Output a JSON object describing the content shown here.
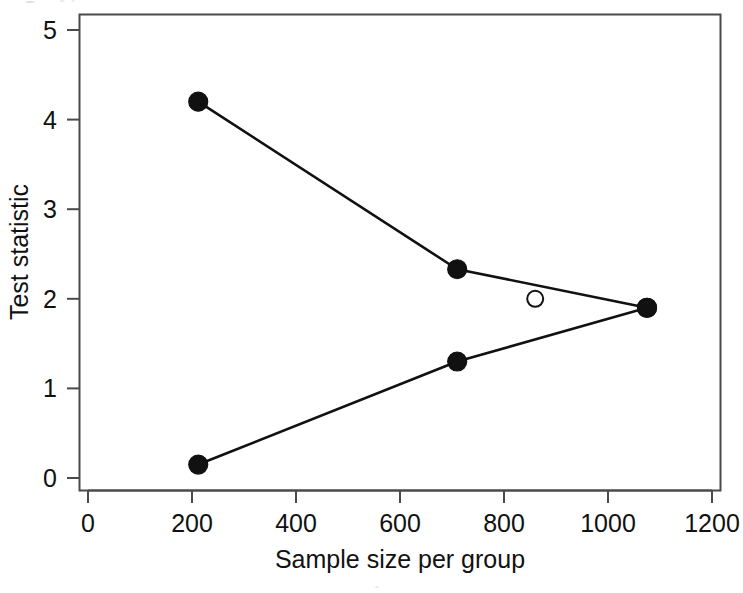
{
  "figure": {
    "background_color": "#ffffff",
    "foreground_color": "#111111"
  },
  "chart_data": {
    "type": "line",
    "title": "",
    "subtitle": "",
    "xlabel": "Sample size per group",
    "ylabel": "Test statistic",
    "xlim": [
      0,
      1250
    ],
    "ylim": [
      0,
      5.2
    ],
    "xticks": [
      0,
      200,
      400,
      600,
      800,
      1000,
      1200
    ],
    "xtick_labels": [
      "0",
      "200",
      "400",
      "600",
      "800",
      "1000",
      "1200"
    ],
    "yticks": [
      0,
      1,
      2,
      3,
      4,
      5
    ],
    "ytick_labels": [
      "0",
      "1",
      "2",
      "3",
      "4",
      "5"
    ],
    "grid": false,
    "legend": null,
    "legend_position": "none",
    "series": [
      {
        "name": "upper-boundary",
        "marker": "filled-circle",
        "line_style": "solid",
        "color": "#111111",
        "x": [
          212,
          710,
          1075
        ],
        "y": [
          4.2,
          2.33,
          1.9
        ]
      },
      {
        "name": "lower-boundary",
        "marker": "filled-circle",
        "line_style": "solid",
        "color": "#111111",
        "x": [
          212,
          710,
          1075
        ],
        "y": [
          0.15,
          1.3,
          1.9
        ]
      },
      {
        "name": "observed-point",
        "marker": "open-circle",
        "line_style": "none",
        "color": "#111111",
        "x": [
          860
        ],
        "y": [
          2.0
        ]
      }
    ],
    "annotations": []
  }
}
